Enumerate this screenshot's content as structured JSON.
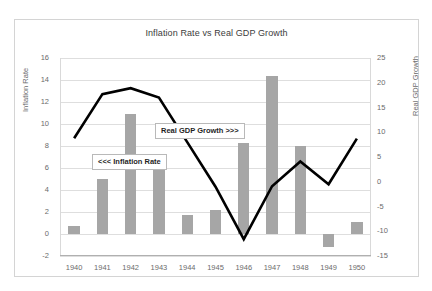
{
  "chart_data": {
    "type": "bar",
    "title": "Inflation Rate vs Real GDP Growth",
    "xlabel": "",
    "ylabel": "Inflation Rate",
    "y2label": "Real GDP Growth",
    "categories": [
      "1940",
      "1941",
      "1942",
      "1943",
      "1944",
      "1945",
      "1946",
      "1947",
      "1948",
      "1949",
      "1950"
    ],
    "ylim": [
      -2,
      16
    ],
    "yticks": [
      -2,
      0,
      2,
      4,
      6,
      8,
      10,
      12,
      14,
      16
    ],
    "y2lim": [
      -15,
      25
    ],
    "y2ticks": [
      -15,
      -10,
      -5,
      0,
      5,
      10,
      15,
      20,
      25
    ],
    "grid": true,
    "legend": "annotations",
    "series": [
      {
        "name": "Inflation Rate",
        "type": "bar",
        "axis": "left",
        "color": "#a6a6a6",
        "values": [
          0.7,
          5.0,
          10.9,
          6.1,
          1.7,
          2.2,
          8.3,
          14.4,
          8.0,
          -1.2,
          1.1
        ]
      },
      {
        "name": "Real GDP Growth",
        "type": "line",
        "axis": "right",
        "color": "#000000",
        "values": [
          8.8,
          17.7,
          18.9,
          17.0,
          8.0,
          -1.0,
          -11.6,
          -0.9,
          4.1,
          -0.5,
          8.7
        ]
      }
    ],
    "annotations": [
      {
        "id": "inflation-callout",
        "text": "<<< Inflation Rate"
      },
      {
        "id": "gdp-callout",
        "text": "Real GDP Growth >>>"
      }
    ]
  },
  "colors": {
    "bar": "#a6a6a6",
    "line": "#000000",
    "grid": "#dedede",
    "frame": "#d4d4d4",
    "text": "#6b6b6b",
    "title": "#3c3c3c",
    "background": "#ffffff"
  }
}
